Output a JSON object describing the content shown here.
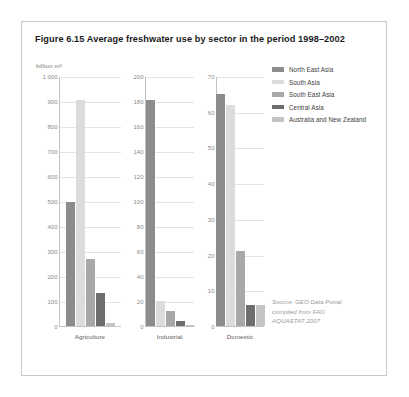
{
  "figure": {
    "title": "Figure 6.15 Average freshwater use by sector in the period 1998–2002",
    "axis_unit": "billion m³"
  },
  "legend": {
    "items": [
      {
        "label": "North East Asia",
        "color": "#8c8c8c"
      },
      {
        "label": "South Asia",
        "color": "#dcdcdc"
      },
      {
        "label": "South East Asia",
        "color": "#a8a8a8"
      },
      {
        "label": "Central Asia",
        "color": "#6e6e6e"
      },
      {
        "label": "Australia and New Zealand",
        "color": "#c4c4c4"
      }
    ]
  },
  "source": {
    "line1": "Source: GEO Data Portal,",
    "line2": "compiled from FAO",
    "line3": "AQUASTAT 2007"
  },
  "chart_data": {
    "type": "bar",
    "title": "Figure 6.15 Average freshwater use by sector in the period 1998–2002",
    "ylabel": "billion m³",
    "xlabel": "",
    "grid": true,
    "legend_position": "right",
    "categories": [
      "Agriculture",
      "Industrial",
      "Domestic"
    ],
    "series": [
      {
        "name": "North East Asia",
        "color": "#8c8c8c",
        "values": [
          497,
          181,
          65
        ]
      },
      {
        "name": "South Asia",
        "color": "#dcdcdc",
        "values": [
          905,
          20,
          62
        ]
      },
      {
        "name": "South East Asia",
        "color": "#a8a8a8",
        "values": [
          268,
          12,
          21
        ]
      },
      {
        "name": "Central Asia",
        "color": "#6e6e6e",
        "values": [
          131,
          4,
          6
        ]
      },
      {
        "name": "Australia and New Zealand",
        "color": "#c4c4c4",
        "values": [
          13,
          1,
          6
        ]
      }
    ],
    "panels": [
      {
        "name": "Agriculture",
        "ylim": [
          0,
          1000
        ],
        "yticks": [
          "0",
          "100",
          "200",
          "300",
          "400",
          "500",
          "600",
          "700",
          "800",
          "900",
          "1 000"
        ],
        "ytick_values": [
          0,
          100,
          200,
          300,
          400,
          500,
          600,
          700,
          800,
          900,
          1000
        ],
        "values": [
          497,
          905,
          268,
          131,
          13
        ]
      },
      {
        "name": "Industrial",
        "ylim": [
          0,
          200
        ],
        "yticks": [
          "0",
          "20",
          "40",
          "60",
          "80",
          "100",
          "120",
          "140",
          "160",
          "180",
          "200"
        ],
        "ytick_values": [
          0,
          20,
          40,
          60,
          80,
          100,
          120,
          140,
          160,
          180,
          200
        ],
        "values": [
          181,
          20,
          12,
          4,
          1
        ]
      },
      {
        "name": "Domestic",
        "ylim": [
          0,
          70
        ],
        "yticks": [
          "0",
          "10",
          "20",
          "30",
          "40",
          "50",
          "60",
          "70"
        ],
        "ytick_values": [
          0,
          10,
          20,
          30,
          40,
          50,
          60,
          70
        ],
        "values": [
          65,
          62,
          21,
          6,
          6
        ]
      }
    ]
  }
}
